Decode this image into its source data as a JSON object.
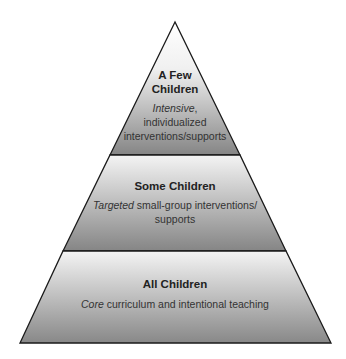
{
  "diagram": {
    "type": "pyramid",
    "colors": {
      "gradient_top": "#f4f4f4",
      "gradient_bottom": "#858585",
      "stroke": "#1a1a1a",
      "text": "#222222"
    },
    "tiers": [
      {
        "title_line1": "A Few",
        "title_line2": "Children",
        "desc_emphasis": "Intensive",
        "desc_line1_rest": ",",
        "desc_line2": "individualized",
        "desc_line3": "interventions/supports"
      },
      {
        "title": "Some Children",
        "desc_emphasis": "Targeted",
        "desc_line1_rest": " small-group interventions/",
        "desc_line2": "supports"
      },
      {
        "title": "All Children",
        "desc_emphasis": "Core",
        "desc_line1_rest": " curriculum and intentional teaching"
      }
    ]
  }
}
